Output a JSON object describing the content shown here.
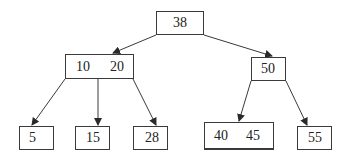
{
  "diagram": {
    "type": "B-tree",
    "stroke_color": "#3a3a3a",
    "nodes": [
      {
        "id": "root",
        "keys": [
          "38"
        ],
        "box": [
          156,
          11,
          48,
          24
        ]
      },
      {
        "id": "n-10-20",
        "keys": [
          "10",
          "20"
        ],
        "box": [
          65,
          54,
          69,
          25
        ]
      },
      {
        "id": "n-50",
        "keys": [
          "50"
        ],
        "box": [
          251,
          57,
          35,
          24
        ]
      },
      {
        "id": "n-5",
        "keys": [
          "5"
        ],
        "box": [
          19,
          126,
          35,
          24
        ]
      },
      {
        "id": "n-15",
        "keys": [
          "15"
        ],
        "box": [
          75,
          126,
          35,
          24
        ]
      },
      {
        "id": "n-28",
        "keys": [
          "28"
        ],
        "box": [
          133,
          126,
          35,
          24
        ]
      },
      {
        "id": "n-40-45",
        "keys": [
          "40",
          "45"
        ],
        "box": [
          204,
          122,
          70,
          28
        ]
      },
      {
        "id": "n-55",
        "keys": [
          "55"
        ],
        "box": [
          297,
          126,
          35,
          24
        ]
      }
    ],
    "edges": [
      {
        "from": "root",
        "to": "n-10-20"
      },
      {
        "from": "root",
        "to": "n-50"
      },
      {
        "from": "n-10-20",
        "to": "n-5"
      },
      {
        "from": "n-10-20",
        "to": "n-15"
      },
      {
        "from": "n-10-20",
        "to": "n-28"
      },
      {
        "from": "n-50",
        "to": "n-40-45"
      },
      {
        "from": "n-50",
        "to": "n-55"
      }
    ]
  },
  "labels": {
    "root": "38",
    "n1_k1": "10",
    "n1_k2": "20",
    "n2_k1": "50",
    "l1": "5",
    "l2": "15",
    "l3": "28",
    "l4_k1": "40",
    "l4_k2": "45",
    "l5": "55"
  }
}
